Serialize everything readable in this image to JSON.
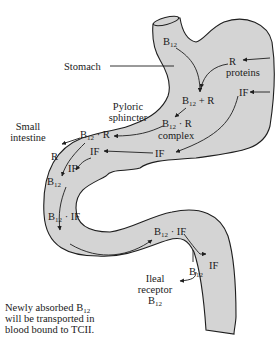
{
  "diagram": {
    "colors": {
      "organ_fill": "#d4d4d4",
      "outline": "#1e1e1e",
      "text": "#1a1a1a",
      "background": "#ffffff"
    },
    "labels": {
      "stomach": "Stomach",
      "pyloric_1": "Pyloric",
      "pyloric_2": "sphincter",
      "small_1": "Small",
      "small_2": "intestine",
      "b": "B",
      "sub12": "12",
      "r": "R",
      "proteins": "proteins",
      "if": "IF",
      "plus_r": " + R",
      "dot_r": " · R",
      "dot_if": " · IF",
      "complex": "complex",
      "ileal": "Ileal",
      "receptor": "receptor",
      "note_1a": "Newly absorbed B",
      "note_2": "will be transported in",
      "note_3": "blood bound to TCII."
    },
    "nodes": [
      {
        "id": "b12-esophagus",
        "text": "B12"
      },
      {
        "id": "r-proteins",
        "text": "R proteins"
      },
      {
        "id": "b12-plus-r",
        "text": "B12 + R"
      },
      {
        "id": "if-stomach",
        "text": "IF"
      },
      {
        "id": "b12-r-complex",
        "text": "B12 · R complex"
      },
      {
        "id": "if-duodenum",
        "text": "IF"
      },
      {
        "id": "b12-r-intestine",
        "text": "B12 · R"
      },
      {
        "id": "if-intestine",
        "text": "IF"
      },
      {
        "id": "r-free",
        "text": "R"
      },
      {
        "id": "if-free",
        "text": "IF"
      },
      {
        "id": "b12-free",
        "text": "B12"
      },
      {
        "id": "b12-if-1",
        "text": "B12 · IF"
      },
      {
        "id": "b12-if-2",
        "text": "B12 · IF"
      },
      {
        "id": "if-released",
        "text": "IF"
      },
      {
        "id": "b12-ileum",
        "text": "B12"
      },
      {
        "id": "ileal-receptor-b12",
        "text": "Ileal receptor B12"
      }
    ],
    "note": "Newly absorbed B12 will be transported in blood bound to TCII."
  }
}
